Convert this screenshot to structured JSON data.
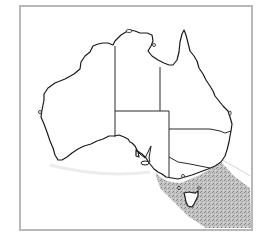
{
  "map": {
    "subject": "Australia",
    "description": "Outline map of Australia with state borders; stippled shaded range over south-eastern coast, Bass Strait and Tasmania",
    "regions": [
      "Western Australia",
      "Northern Territory",
      "Queensland",
      "South Australia",
      "New South Wales",
      "Victoria",
      "Tasmania"
    ],
    "shaded_area": {
      "label": "distribution range",
      "location": "south-eastern Australia coastal waters incl. Tasmania",
      "fill_color": "#a8a8a8"
    },
    "colors": {
      "frame": "#b8b8b8",
      "coastline": "#1a1a1a",
      "background": "#ffffff"
    }
  }
}
